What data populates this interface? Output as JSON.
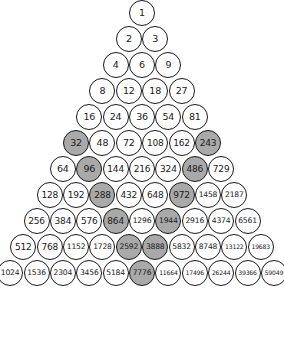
{
  "figure": {
    "title": "",
    "shaded_color": "#a9a9a9",
    "cell_color": "#ffffff",
    "outline_color": "#1a1a1a",
    "rows": [
      {
        "index": 1,
        "cells": [
          {
            "value": "1",
            "shaded": false
          }
        ]
      },
      {
        "index": 2,
        "cells": [
          {
            "value": "2",
            "shaded": false
          },
          {
            "value": "3",
            "shaded": false
          }
        ]
      },
      {
        "index": 3,
        "cells": [
          {
            "value": "4",
            "shaded": false
          },
          {
            "value": "6",
            "shaded": false
          },
          {
            "value": "9",
            "shaded": false
          }
        ]
      },
      {
        "index": 4,
        "cells": [
          {
            "value": "8",
            "shaded": false
          },
          {
            "value": "12",
            "shaded": false
          },
          {
            "value": "18",
            "shaded": false
          },
          {
            "value": "27",
            "shaded": false
          }
        ]
      },
      {
        "index": 5,
        "cells": [
          {
            "value": "16",
            "shaded": false
          },
          {
            "value": "24",
            "shaded": false
          },
          {
            "value": "36",
            "shaded": false
          },
          {
            "value": "54",
            "shaded": false
          },
          {
            "value": "81",
            "shaded": false
          }
        ]
      },
      {
        "index": 6,
        "cells": [
          {
            "value": "32",
            "shaded": true
          },
          {
            "value": "48",
            "shaded": false
          },
          {
            "value": "72",
            "shaded": false
          },
          {
            "value": "108",
            "shaded": false
          },
          {
            "value": "162",
            "shaded": false
          },
          {
            "value": "243",
            "shaded": true
          }
        ]
      },
      {
        "index": 7,
        "cells": [
          {
            "value": "64",
            "shaded": false
          },
          {
            "value": "96",
            "shaded": true
          },
          {
            "value": "144",
            "shaded": false
          },
          {
            "value": "216",
            "shaded": false
          },
          {
            "value": "324",
            "shaded": false
          },
          {
            "value": "486",
            "shaded": true
          },
          {
            "value": "729",
            "shaded": false
          }
        ]
      },
      {
        "index": 8,
        "cells": [
          {
            "value": "128",
            "shaded": false
          },
          {
            "value": "192",
            "shaded": false
          },
          {
            "value": "288",
            "shaded": true
          },
          {
            "value": "432",
            "shaded": false
          },
          {
            "value": "648",
            "shaded": false
          },
          {
            "value": "972",
            "shaded": true
          },
          {
            "value": "1458",
            "shaded": false
          },
          {
            "value": "2187",
            "shaded": false
          }
        ]
      },
      {
        "index": 9,
        "cells": [
          {
            "value": "256",
            "shaded": false
          },
          {
            "value": "384",
            "shaded": false
          },
          {
            "value": "576",
            "shaded": false
          },
          {
            "value": "864",
            "shaded": true
          },
          {
            "value": "1296",
            "shaded": false
          },
          {
            "value": "1944",
            "shaded": true
          },
          {
            "value": "2916",
            "shaded": false
          },
          {
            "value": "4374",
            "shaded": false
          },
          {
            "value": "6561",
            "shaded": false
          }
        ]
      },
      {
        "index": 10,
        "cells": [
          {
            "value": "512",
            "shaded": false
          },
          {
            "value": "768",
            "shaded": false
          },
          {
            "value": "1152",
            "shaded": false
          },
          {
            "value": "1728",
            "shaded": false
          },
          {
            "value": "2592",
            "shaded": true
          },
          {
            "value": "3888",
            "shaded": true
          },
          {
            "value": "5832",
            "shaded": false
          },
          {
            "value": "8748",
            "shaded": false
          },
          {
            "value": "13122",
            "shaded": false
          },
          {
            "value": "19683",
            "shaded": false
          }
        ]
      },
      {
        "index": 11,
        "cells": [
          {
            "value": "1024",
            "shaded": false
          },
          {
            "value": "1536",
            "shaded": false
          },
          {
            "value": "2304",
            "shaded": false
          },
          {
            "value": "3456",
            "shaded": false
          },
          {
            "value": "5184",
            "shaded": false
          },
          {
            "value": "7776",
            "shaded": true
          },
          {
            "value": "11664",
            "shaded": false
          },
          {
            "value": "17496",
            "shaded": false
          },
          {
            "value": "26244",
            "shaded": false
          },
          {
            "value": "39366",
            "shaded": false
          },
          {
            "value": "59049",
            "shaded": false
          }
        ]
      }
    ]
  }
}
